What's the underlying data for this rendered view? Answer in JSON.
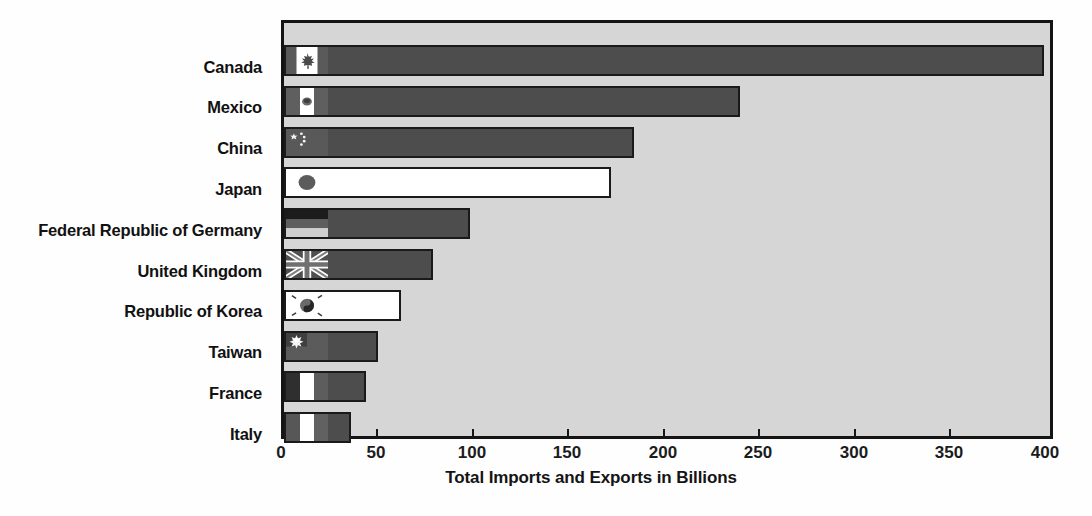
{
  "chart_data": {
    "type": "bar",
    "orientation": "horizontal",
    "title": "",
    "xlabel": "Total Imports and Exports in Billions",
    "ylabel": "",
    "xlim": [
      0,
      400
    ],
    "xticks": [
      0,
      50,
      100,
      150,
      200,
      250,
      300,
      350,
      400
    ],
    "xtick_labels": [
      "0",
      "50",
      "100",
      "150",
      "200",
      "250",
      "300",
      "350",
      "400"
    ],
    "grid": false,
    "legend": "none",
    "categories": [
      "Canada",
      "Mexico",
      "China",
      "Japan",
      "Federal Republic of Germany",
      "United Kingdom",
      "Republic of Korea",
      "Taiwan",
      "France",
      "Italy"
    ],
    "values": [
      397,
      238,
      183,
      171,
      97,
      78,
      61,
      49,
      43,
      35
    ],
    "bar_fill": [
      "dark",
      "dark",
      "dark",
      "white",
      "dark",
      "dark",
      "white",
      "dark",
      "dark",
      "dark"
    ],
    "flags": [
      "canada-flag",
      "mexico-flag",
      "china-flag",
      "japan-flag",
      "germany-flag",
      "united-kingdom-flag",
      "south-korea-flag",
      "taiwan-flag",
      "france-flag",
      "italy-flag"
    ]
  },
  "colors": {
    "plot_background": "#d6d6d6",
    "bar_dark": "#4d4d4d",
    "bar_white": "#ffffff",
    "border": "#141414",
    "text": "#111111"
  },
  "labels": {
    "c0": "Canada",
    "c1": "Mexico",
    "c2": "China",
    "c3": "Japan",
    "c4": "Federal Republic of Germany",
    "c5": "United Kingdom",
    "c6": "Republic of Korea",
    "c7": "Taiwan",
    "c8": "France",
    "c9": "Italy"
  },
  "axis": {
    "t0": "0",
    "t1": "50",
    "t2": "100",
    "t3": "150",
    "t4": "200",
    "t5": "250",
    "t6": "300",
    "t7": "350",
    "t8": "400",
    "title": "Total Imports and Exports in Billions"
  }
}
